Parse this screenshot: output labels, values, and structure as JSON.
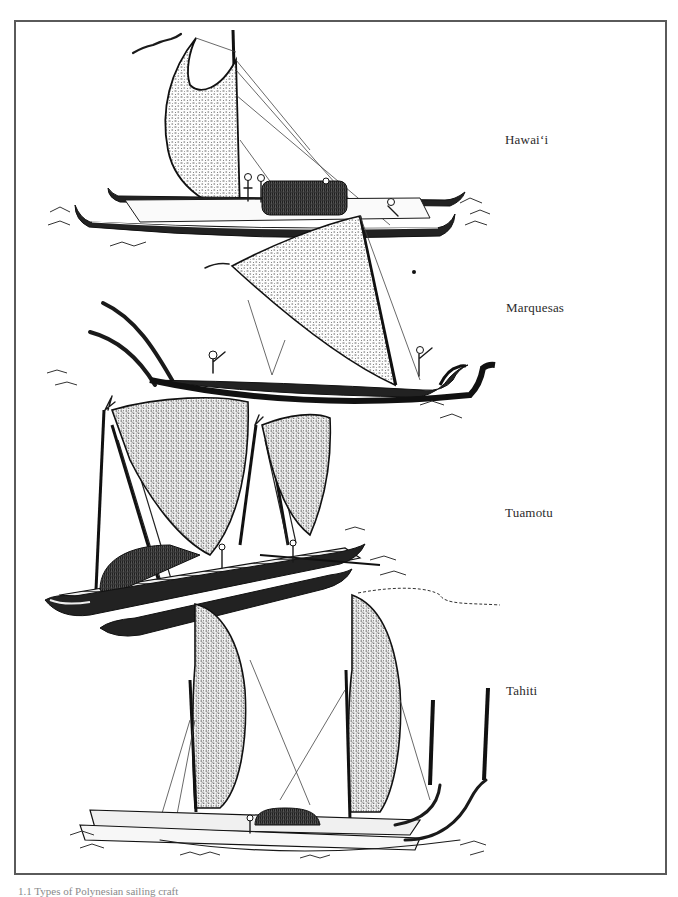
{
  "figure": {
    "labels": [
      {
        "id": "hawaii",
        "text": "Hawai‘i",
        "x": 505,
        "y": 132
      },
      {
        "id": "marquesas",
        "text": "Marquesas",
        "x": 506,
        "y": 300
      },
      {
        "id": "tuamotu",
        "text": "Tuamotu",
        "x": 505,
        "y": 505
      },
      {
        "id": "tahiti",
        "text": "Tahiti",
        "x": 506,
        "y": 683
      }
    ],
    "caption": "1.1 Types of Polynesian sailing craft"
  },
  "colors": {
    "ink": "#1a1a1a",
    "frame": "#5a5a5a",
    "label": "#2b2b2b",
    "paper": "#ffffff"
  }
}
